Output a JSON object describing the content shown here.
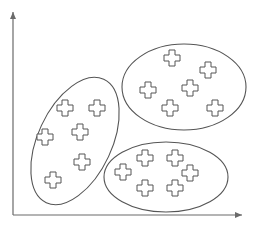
{
  "diagram": {
    "type": "cluster-scatter",
    "stroke_color": "#555555",
    "axis_color": "#6a6a6a",
    "background": "#ffffff",
    "axes": {
      "origin": [
        13,
        215
      ],
      "x_end": [
        242,
        215
      ],
      "y_end": [
        13,
        12
      ],
      "x_label": "",
      "y_label": ""
    },
    "clusters": [
      {
        "name": "left-cluster",
        "ellipse": {
          "cx": 75,
          "cy": 141,
          "rx": 37,
          "ry": 68,
          "rotate": 25
        },
        "points": [
          [
            65,
            108
          ],
          [
            97,
            108
          ],
          [
            45,
            137
          ],
          [
            80,
            132
          ],
          [
            82,
            162
          ],
          [
            53,
            180
          ]
        ]
      },
      {
        "name": "top-right-cluster",
        "ellipse": {
          "cx": 184,
          "cy": 87,
          "rx": 62,
          "ry": 43,
          "rotate": 0
        },
        "points": [
          [
            172,
            58
          ],
          [
            208,
            70
          ],
          [
            148,
            90
          ],
          [
            190,
            88
          ],
          [
            170,
            108
          ],
          [
            215,
            108
          ]
        ]
      },
      {
        "name": "bottom-right-cluster",
        "ellipse": {
          "cx": 166,
          "cy": 177,
          "rx": 62,
          "ry": 35,
          "rotate": 0
        },
        "points": [
          [
            123,
            172
          ],
          [
            145,
            158
          ],
          [
            175,
            158
          ],
          [
            190,
            173
          ],
          [
            145,
            188
          ],
          [
            175,
            188
          ]
        ]
      }
    ],
    "point_marker": "cross-outline-icon"
  }
}
